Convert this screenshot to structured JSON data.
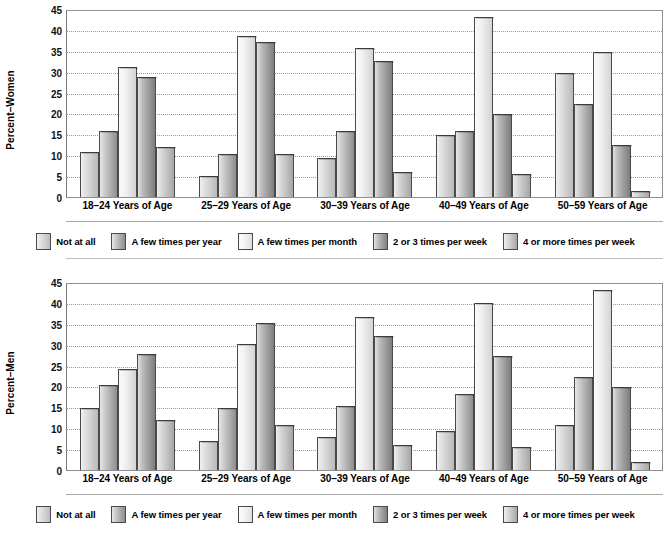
{
  "chart_data": [
    {
      "type": "bar",
      "title": "",
      "ylabel": "Percent–Women",
      "xlabel": "",
      "ylim": [
        0,
        45
      ],
      "yticks": [
        0,
        5,
        10,
        15,
        20,
        25,
        30,
        35,
        40,
        45
      ],
      "grid": true,
      "legend_position": "bottom",
      "categories": [
        "18–24 Years of Age",
        "25–29 Years of Age",
        "30–39 Years of Age",
        "40–49 Years of Age",
        "50–59 Years of Age"
      ],
      "series": [
        {
          "name": "Not at all",
          "values": [
            11,
            5,
            9.5,
            15,
            30
          ]
        },
        {
          "name": "A few times per year",
          "values": [
            16,
            10.5,
            16,
            16,
            22.5
          ]
        },
        {
          "name": "A few times per month",
          "values": [
            31.5,
            39,
            36,
            43.5,
            35
          ]
        },
        {
          "name": "2 or 3 times per week",
          "values": [
            29,
            37.5,
            33,
            20,
            12.5
          ]
        },
        {
          "name": "4 or more times per week",
          "values": [
            12,
            10.5,
            6,
            5.5,
            1.5
          ]
        }
      ]
    },
    {
      "type": "bar",
      "title": "",
      "ylabel": "Percent–Men",
      "xlabel": "",
      "ylim": [
        0,
        45
      ],
      "yticks": [
        0,
        5,
        10,
        15,
        20,
        25,
        30,
        35,
        40,
        45
      ],
      "grid": true,
      "legend_position": "bottom",
      "categories": [
        "18–24 Years of Age",
        "25–29 Years of Age",
        "30–39 Years of Age",
        "40–49 Years of Age",
        "50–59 Years of Age"
      ],
      "series": [
        {
          "name": "Not at all",
          "values": [
            15,
            7,
            8,
            9.5,
            11
          ]
        },
        {
          "name": "A few times per year",
          "values": [
            20.5,
            15,
            15.5,
            18.5,
            22.5
          ]
        },
        {
          "name": "A few times per month",
          "values": [
            24.5,
            30.5,
            37,
            40.5,
            43.5
          ]
        },
        {
          "name": "2 or 3 times per week",
          "values": [
            28,
            35.5,
            32.5,
            27.5,
            20
          ]
        },
        {
          "name": "4 or more times per week",
          "values": [
            12,
            11,
            6,
            5.5,
            2
          ]
        }
      ]
    }
  ],
  "colors": {
    "series_1": "#dcdcdc",
    "series_2": "#c4c4c4",
    "series_3": "#f4f4f4",
    "series_4": "#bdbdbd",
    "series_5": "#d6d6d6",
    "axis": "#6e6e6e",
    "grid": "#9a9a9a",
    "text": "#000000"
  }
}
